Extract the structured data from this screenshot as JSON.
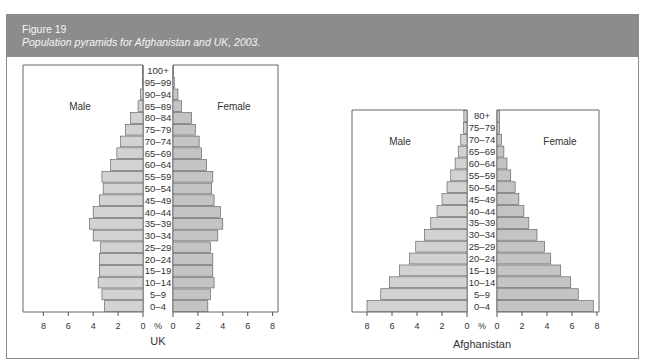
{
  "figure": {
    "number": "Figure 19",
    "caption": "Population pyramids for Afghanistan and UK, 2003."
  },
  "colors": {
    "header_bg": "#8c8c8c",
    "male_bar": "#d2d2d2",
    "female_bar": "#c4c4c4",
    "bar_stroke": "#555555",
    "axis": "#555555"
  },
  "chart_data": [
    {
      "type": "bar",
      "orientation": "horizontal-pyramid",
      "title": "UK",
      "xlabel": "%",
      "left_label": "Male",
      "right_label": "Female",
      "xlim": [
        0,
        8
      ],
      "xticks": [
        8,
        6,
        4,
        2,
        0
      ],
      "categories": [
        "100+",
        "95–99",
        "90–94",
        "85–89",
        "80–84",
        "75–79",
        "70–74",
        "65–69",
        "60–64",
        "55–59",
        "50–54",
        "45–49",
        "40–44",
        "35–39",
        "30–34",
        "25–29",
        "20–24",
        "15–19",
        "10–14",
        "5–9",
        "0–4"
      ],
      "series": [
        {
          "name": "Male",
          "values": [
            0.02,
            0.05,
            0.2,
            0.4,
            1.0,
            1.4,
            1.8,
            2.1,
            2.6,
            3.3,
            3.2,
            3.5,
            4.0,
            4.3,
            4.0,
            3.4,
            3.5,
            3.5,
            3.6,
            3.3,
            3.1
          ]
        },
        {
          "name": "Female",
          "values": [
            0.05,
            0.1,
            0.4,
            0.7,
            1.5,
            1.8,
            2.1,
            2.3,
            2.7,
            3.2,
            3.1,
            3.3,
            3.8,
            4.0,
            3.6,
            3.0,
            3.2,
            3.2,
            3.3,
            3.0,
            2.8
          ]
        }
      ],
      "grid": false
    },
    {
      "type": "bar",
      "orientation": "horizontal-pyramid",
      "title": "Afghanistan",
      "xlabel": "%",
      "left_label": "Male",
      "right_label": "Female",
      "xlim": [
        0,
        8
      ],
      "xticks": [
        8,
        6,
        4,
        2,
        0
      ],
      "categories": [
        "80+",
        "75–79",
        "70–74",
        "65–69",
        "60–64",
        "55–59",
        "50–54",
        "45–49",
        "40–44",
        "35–39",
        "30–34",
        "25–29",
        "20–24",
        "15–19",
        "10–14",
        "5–9",
        "0–4"
      ],
      "series": [
        {
          "name": "Male",
          "values": [
            0.25,
            0.3,
            0.5,
            0.7,
            0.95,
            1.3,
            1.6,
            2.0,
            2.4,
            2.9,
            3.4,
            4.1,
            4.6,
            5.4,
            6.2,
            6.9,
            8.0
          ]
        },
        {
          "name": "Female",
          "values": [
            0.2,
            0.2,
            0.35,
            0.55,
            0.8,
            1.1,
            1.45,
            1.75,
            2.15,
            2.55,
            3.2,
            3.8,
            4.3,
            5.1,
            5.9,
            6.5,
            7.7
          ]
        }
      ],
      "grid": false
    }
  ]
}
